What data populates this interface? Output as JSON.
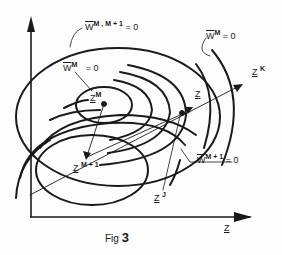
{
  "figure": {
    "caption_prefix": "Fig",
    "caption_number": "3",
    "x_axis_label": "Z",
    "labels": {
      "w_m_m1": {
        "base": "W",
        "sup": "M , M + 1",
        "rhs": "= 0"
      },
      "w_m_inner": {
        "base": "W",
        "sup": "M",
        "rhs": "= 0"
      },
      "w_m_right": {
        "base": "W",
        "sup": "M",
        "rhs": "= 0"
      },
      "w_m1": {
        "base": "W",
        "sup": "M + 1",
        "rhs": "= 0"
      },
      "z_m": {
        "base": "Z",
        "sup": "M"
      },
      "z_m1": {
        "base": "Z",
        "sup": "M + 1"
      },
      "z_dot": {
        "base": "Z",
        "accent": "•"
      },
      "z_k": {
        "base": "Z",
        "sup": "K"
      },
      "z_j": {
        "base": "Z",
        "sup": "J"
      }
    },
    "colors": {
      "ink": "#1a1a1a",
      "paper": "#fdfdfd"
    }
  }
}
